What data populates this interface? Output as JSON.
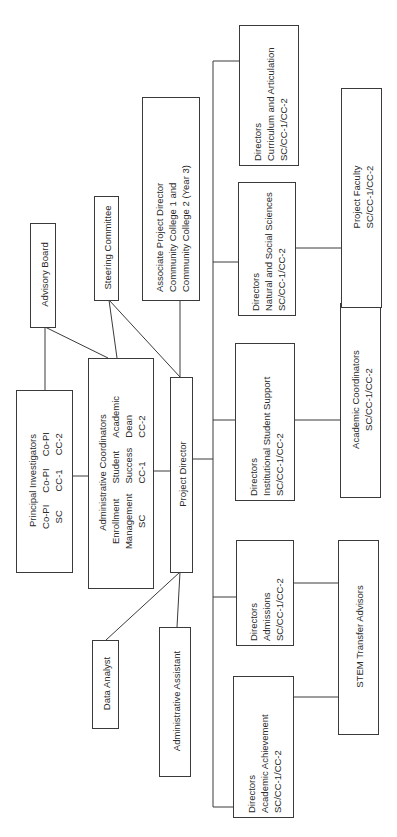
{
  "diagram": {
    "type": "org-chart",
    "orientation": "rotated-90-ccw",
    "line_color": "#3a3a3a",
    "nodes": {
      "advisory_board": {
        "label": "Advisory Board"
      },
      "steering_committee": {
        "label": "Steering Committee"
      },
      "associate_pd": {
        "lines": [
          "Associate Project Director",
          "Community College 1 and",
          "Community College 2 (Year 3)"
        ]
      },
      "principal_investigators": {
        "title": "Principal Investigators",
        "columns": [
          {
            "role": "Co-PI",
            "org": "SC"
          },
          {
            "role": "Co-PI",
            "org": "CC-1"
          },
          {
            "role": "Co-PI",
            "org": "CC-2"
          }
        ]
      },
      "admin_coordinators": {
        "title": "Administrative Coordinators",
        "columns": [
          {
            "l1": "Enrollment",
            "l2": "Management",
            "l3": "SC"
          },
          {
            "l1": "Student",
            "l2": "Success",
            "l3": "CC-1"
          },
          {
            "l1": "Academic",
            "l2": "Dean",
            "l3": "CC-2"
          }
        ]
      },
      "project_director": {
        "label": "Project Director"
      },
      "data_analyst": {
        "label": "Data Analyst"
      },
      "admin_assistant": {
        "label": "Administrative Assistant"
      },
      "dir_academic_achievement": {
        "lines": [
          "Directors",
          "Academic Achievement",
          "SC/CC-1/CC-2"
        ]
      },
      "dir_admissions": {
        "lines": [
          "Directors",
          "Admissions",
          "SC/CC-1/CC-2"
        ]
      },
      "dir_institutional_support": {
        "lines": [
          "Directors",
          "Institutional Student Support",
          "SC/CC-1/CC-2"
        ]
      },
      "dir_natural_social": {
        "lines": [
          "Directors",
          "Natural and Social Sciences",
          "SC/CC-1/CC-2"
        ]
      },
      "dir_curriculum": {
        "lines": [
          "Directors",
          "Curriculum and Articulation",
          "SC/CC-1/CC-2"
        ]
      },
      "stem_transfer_advisors": {
        "label": "STEM Transfer Advisors"
      },
      "academic_coordinators": {
        "lines": [
          "Academic Coordinators",
          "SC/CC-1/CC-2"
        ]
      },
      "project_faculty": {
        "lines": [
          "Project Faculty",
          "SC/CC-1/CC-2"
        ]
      }
    },
    "edges": [
      [
        "principal_investigators",
        "advisory_board"
      ],
      [
        "admin_coordinators",
        "advisory_board"
      ],
      [
        "admin_coordinators",
        "steering_committee"
      ],
      [
        "project_director",
        "steering_committee"
      ],
      [
        "project_director",
        "associate_pd"
      ],
      [
        "principal_investigators",
        "admin_coordinators"
      ],
      [
        "admin_coordinators",
        "project_director"
      ],
      [
        "project_director",
        "data_analyst"
      ],
      [
        "project_director",
        "admin_assistant"
      ],
      [
        "project_director",
        "dir_academic_achievement"
      ],
      [
        "project_director",
        "dir_admissions"
      ],
      [
        "project_director",
        "dir_institutional_support"
      ],
      [
        "project_director",
        "dir_natural_social"
      ],
      [
        "project_director",
        "dir_curriculum"
      ],
      [
        "dir_academic_achievement",
        "stem_transfer_advisors"
      ],
      [
        "dir_admissions",
        "stem_transfer_advisors"
      ],
      [
        "dir_institutional_support",
        "academic_coordinators"
      ],
      [
        "dir_natural_social",
        "project_faculty"
      ]
    ]
  }
}
